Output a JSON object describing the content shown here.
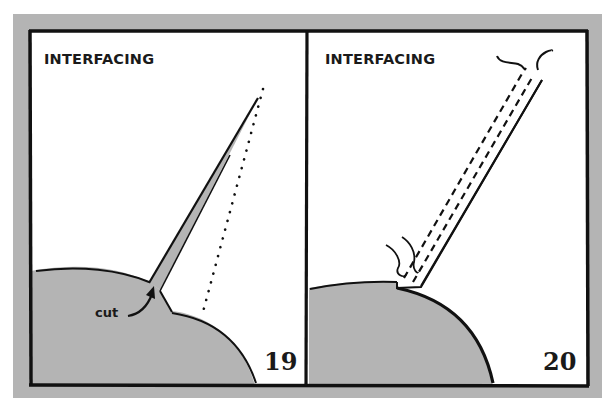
{
  "figure": {
    "background_frame_color": "#b4b4b4",
    "fabric_color": "#b4b4b4",
    "line_color": "#111111",
    "panels": [
      {
        "id": 19,
        "title": "INTERFACING",
        "number": "19",
        "labels": {
          "cut": "cut"
        },
        "elements": [
          "curved-fabric-edge",
          "interfacing-strip-folded",
          "dotted-fold-line",
          "cut-arrow"
        ]
      },
      {
        "id": 20,
        "title": "INTERFACING",
        "number": "20",
        "elements": [
          "curved-fabric-edge",
          "interfacing-strip-lifted",
          "dashed-stitch-lines",
          "squiggle-thread-marks"
        ]
      }
    ]
  }
}
